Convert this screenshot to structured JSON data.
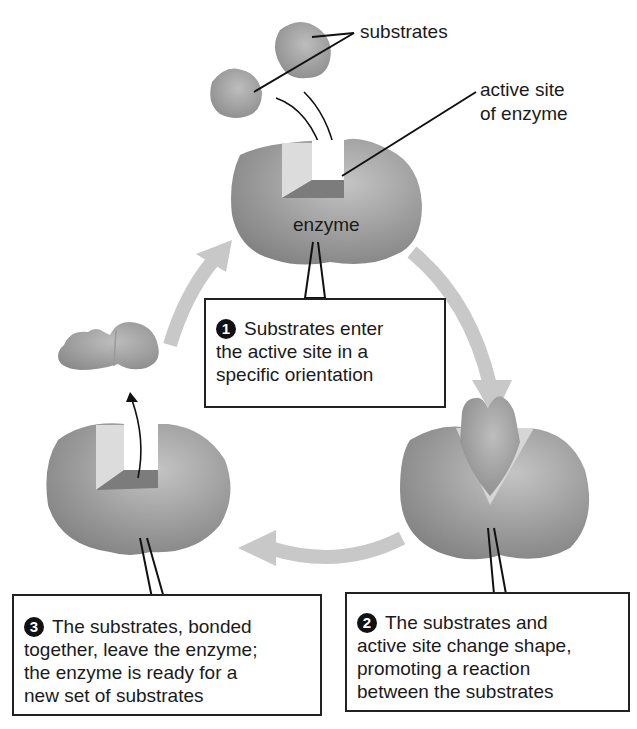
{
  "labels": {
    "substrates": "substrates",
    "active_site_line1": "active site",
    "active_site_line2": "of enzyme",
    "enzyme": "enzyme"
  },
  "steps": [
    {
      "number": "1",
      "lines": [
        "Substrates enter",
        "the active site in a",
        "specific orientation"
      ]
    },
    {
      "number": "2",
      "lines": [
        "The substrates and",
        "active site change shape,",
        "promoting a reaction",
        "between the substrates"
      ]
    },
    {
      "number": "3",
      "lines": [
        "The substrates, bonded",
        "together, leave the enzyme;",
        "the enzyme is ready for a",
        "new set of substrates"
      ]
    }
  ],
  "colors": {
    "enzyme": "#8f8f8f",
    "cycle_arrow": "#c8c8c8",
    "active_site_light": "#d9d9d9",
    "active_site_dark": "#7a7a7a",
    "outline": "#222222"
  }
}
